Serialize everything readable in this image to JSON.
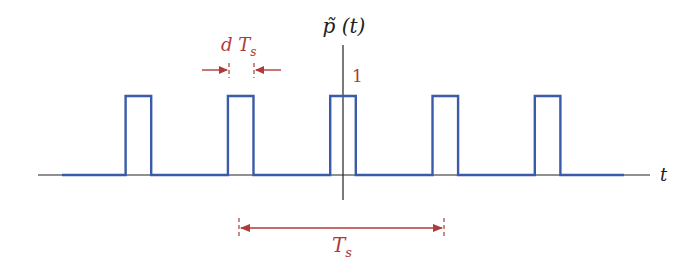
{
  "diagram": {
    "y_axis_label": "p̃ (t)",
    "x_axis_label": "t",
    "amplitude_label": "1",
    "pulse_width_label": "d T",
    "pulse_width_subscript": "s",
    "period_label": "T",
    "period_subscript": "s",
    "pulse_count": 5,
    "pulse_amplitude": 1,
    "duty_cycle": 0.125,
    "colors": {
      "signal": "#3a5ba8",
      "annotation": "#b03a3a",
      "axis": "#222222"
    }
  }
}
